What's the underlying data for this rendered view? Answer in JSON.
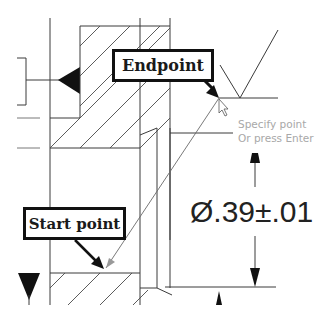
{
  "app": {
    "view": "CAD drawing viewport - line tool"
  },
  "callouts": {
    "endpoint": "Endpoint",
    "start_point": "Start point"
  },
  "prompt": {
    "line1": "Specify point",
    "line2": "Or press Enter"
  },
  "dimension": {
    "text": "Ø.39±.01",
    "symbol": "diameter",
    "value": ".39",
    "tolerance": "±.01"
  },
  "icons": {
    "cursor": "arrow-cursor-icon",
    "endpoint_snap": "endpoint-snap-marker-icon"
  },
  "colors": {
    "line": "#3a3a3a",
    "callout_border": "#111111",
    "prompt_text": "#a8a8a8",
    "background": "#ffffff"
  }
}
